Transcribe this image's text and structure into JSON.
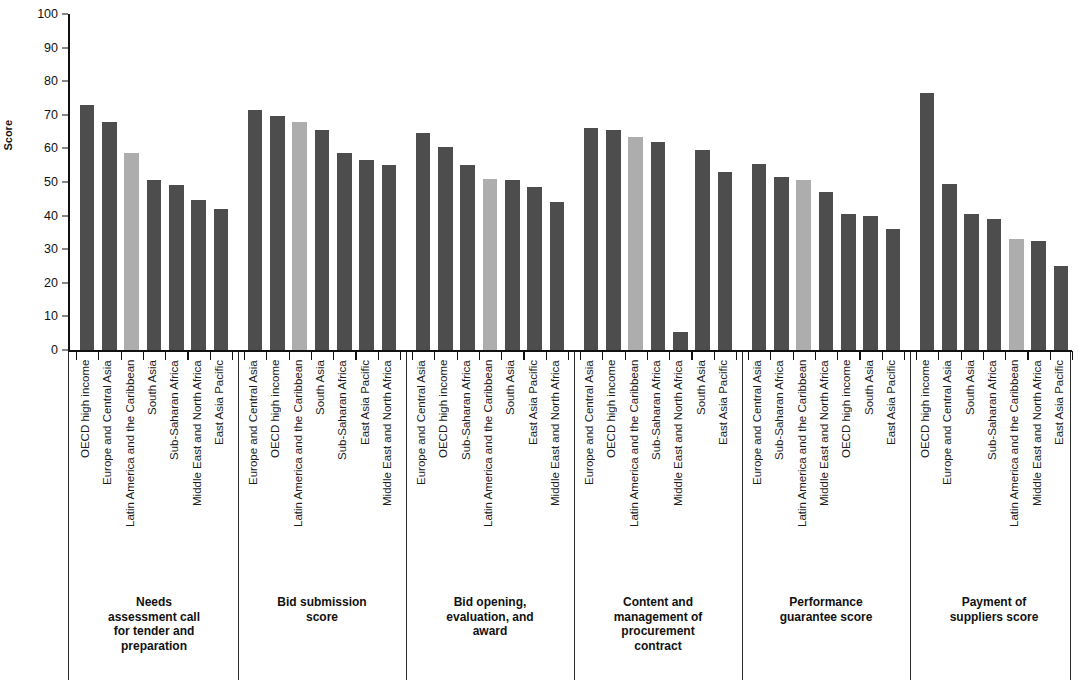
{
  "chart_data": {
    "type": "bar",
    "title": "",
    "xlabel": "",
    "ylabel": "Score",
    "ylim": [
      0,
      100
    ],
    "ytick_values": [
      0,
      10,
      20,
      30,
      40,
      50,
      60,
      70,
      80,
      90,
      100
    ],
    "grid": false,
    "legend": null,
    "colors": {
      "dark_bar": "#4d4d4d",
      "light_bar": "#adadad",
      "axis": "#111111",
      "text": "#1a1a1a",
      "background": "#ffffff"
    },
    "highlight_category": "Latin America and the Caribbean",
    "groups": [
      {
        "title": "Needs assessment call for tender and preparation",
        "title_lines": [
          "Needs",
          "assessment call",
          "for tender and",
          "preparation"
        ],
        "categories": [
          "OECD high income",
          "Europe and Central Asia",
          "Latin America and the Caribbean",
          "South Asia",
          "Sub-Saharan Africa",
          "Middle East and North Africa",
          "East Asia Pacific"
        ],
        "values": [
          73,
          68,
          58.5,
          50.5,
          49,
          44.5,
          42
        ]
      },
      {
        "title": "Bid submission score",
        "title_lines": [
          "Bid submission",
          "score"
        ],
        "categories": [
          "Europe and Central Asia",
          "OECD high income",
          "Latin America and the Caribbean",
          "South Asia",
          "Sub-Saharan Africa",
          "East Asia Pacific",
          "Middle East and North Africa"
        ],
        "values": [
          71.5,
          69.5,
          68,
          65.5,
          58.5,
          56.5,
          55
        ]
      },
      {
        "title": "Bid opening, evaluation, and award",
        "title_lines": [
          "Bid opening,",
          "evaluation, and",
          "award"
        ],
        "categories": [
          "Europe and Central Asia",
          "OECD high income",
          "Sub-Saharan Africa",
          "Latin America and the Caribbean",
          "South Asia",
          "East Asia Pacific",
          "Middle East and North Africa"
        ],
        "values": [
          64.5,
          60.5,
          55,
          51,
          50.5,
          48.5,
          44
        ]
      },
      {
        "title": "Content and management of procurement contract",
        "title_lines": [
          "Content and",
          "management of",
          "procurement",
          "contract"
        ],
        "categories": [
          "Europe and Central Asia",
          "OECD high income",
          "Latin America and the Caribbean",
          "Sub-Saharan Africa",
          "Middle East and North Africa",
          "South Asia",
          "East Asia Pacific"
        ],
        "values": [
          66,
          65.5,
          63.5,
          62,
          5.5,
          59.5,
          53
        ]
      },
      {
        "title": "Performance guarantee score",
        "title_lines": [
          "Performance",
          "guarantee score"
        ],
        "categories": [
          "Europe and Central Asia",
          "Sub-Saharan Africa",
          "Latin America and the Caribbean",
          "Middle East and North Africa",
          "OECD high income",
          "South Asia",
          "East Asia Pacific"
        ],
        "values": [
          55.5,
          51.5,
          50.5,
          47,
          40.5,
          40,
          36
        ]
      },
      {
        "title": "Payment of suppliers score",
        "title_lines": [
          "Payment of",
          "suppliers score"
        ],
        "categories": [
          "OECD high income",
          "Europe and Central Asia",
          "South Asia",
          "Sub-Saharan Africa",
          "Latin America and the Caribbean",
          "Middle East and North Africa",
          "East Asia Pacific"
        ],
        "values": [
          76.5,
          49.5,
          40.5,
          39,
          33,
          32.5,
          25
        ]
      }
    ]
  }
}
